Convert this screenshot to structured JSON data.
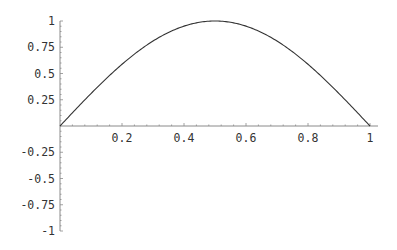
{
  "chart_data": {
    "type": "line",
    "title": "",
    "xlabel": "",
    "ylabel": "",
    "function": "sin(pi x)",
    "xlim": [
      0,
      1
    ],
    "ylim": [
      -1,
      1
    ],
    "grid": false,
    "legend": null,
    "x_ticks": [
      0.2,
      0.4,
      0.6,
      0.8,
      1
    ],
    "x_tick_labels": [
      "0.2",
      "0.4",
      "0.6",
      "0.8",
      "1"
    ],
    "y_ticks": [
      1,
      0.75,
      0.5,
      0.25,
      -0.25,
      -0.5,
      -0.75,
      -1
    ],
    "y_tick_labels": [
      "1",
      "0.75",
      "0.5",
      "0.25",
      "-0.25",
      "-0.5",
      "-0.75",
      "-1"
    ],
    "series": [
      {
        "name": "curve",
        "x": [
          0,
          0.1,
          0.2,
          0.3,
          0.4,
          0.5,
          0.6,
          0.7,
          0.8,
          0.9,
          1.0
        ],
        "values": [
          0,
          0.309,
          0.588,
          0.809,
          0.951,
          1.0,
          0.951,
          0.809,
          0.588,
          0.309,
          0
        ]
      }
    ],
    "colors": {
      "line": "#333333",
      "axis": "#888888",
      "text": "#333333"
    }
  }
}
